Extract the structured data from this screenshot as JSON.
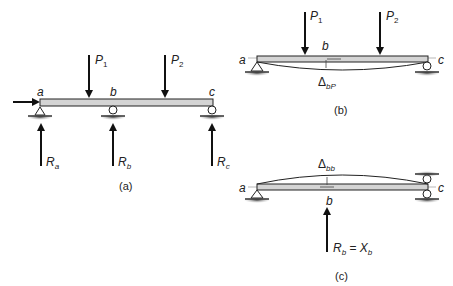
{
  "figure": {
    "panels": [
      {
        "id": "a",
        "caption": "(a)",
        "points": [
          "a",
          "b",
          "c"
        ],
        "loads": [
          "P",
          "P"
        ],
        "load_subs": [
          "1",
          "2"
        ],
        "reactions": [
          {
            "base": "R",
            "sub": "a"
          },
          {
            "base": "R",
            "sub": "b"
          },
          {
            "base": "R",
            "sub": "c"
          }
        ]
      },
      {
        "id": "b",
        "caption": "(b)",
        "points": [
          "a",
          "b",
          "c"
        ],
        "loads": [
          "P",
          "P"
        ],
        "load_subs": [
          "1",
          "2"
        ],
        "deflection": {
          "symbol": "Δ",
          "sub": "bP"
        }
      },
      {
        "id": "c",
        "caption": "(c)",
        "points": [
          "a",
          "b",
          "c"
        ],
        "deflection": {
          "symbol": "Δ",
          "sub": "bb"
        },
        "redundant": {
          "lhs": "R",
          "lhs_sub": "b",
          "eq": " = ",
          "rhs": "X",
          "rhs_sub": "b"
        }
      }
    ]
  },
  "colors": {
    "beam_fill": "#d4d4d4",
    "ink": "#111111",
    "ground": "#555555"
  }
}
